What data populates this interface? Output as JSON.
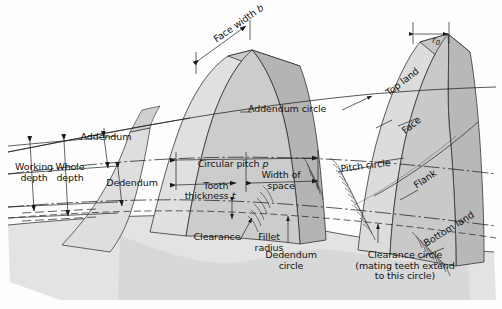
{
  "figure": {
    "colors": {
      "body_light": "#d9d9d9",
      "body_mid": "#c6c6c6",
      "body_dark": "#aaaaaa",
      "body_pale": "#e8e8e8",
      "line": "#1a1a1a",
      "paper": "#fdfdfd",
      "text": "#141414"
    }
  },
  "labels": {
    "face_width": "Face width",
    "face_width_sym": "b",
    "addendum": "Addendum",
    "working_depth": "Working\ndepth",
    "whole_depth": "Whole\ndepth",
    "dedendum": "Dedendum",
    "addendum_circle": "Addendum circle",
    "circular_pitch": "Circular pitch",
    "circular_pitch_sym": "p",
    "tooth_thickness": "Tooth\nthickness",
    "tooth_thickness_sym": "t",
    "width_of_space": "Width of\nspace",
    "pitch_circle": "Pitch circle",
    "clearance": "Clearance",
    "fillet_radius": "Fillet\nradius",
    "dedendum_circle": "Dedendum\ncircle",
    "clearance_circle": "Clearance circle\n(mating teeth extend\nto this circle)",
    "top_land": "Top land",
    "face": "Face",
    "flank": "Flank",
    "bottom_land": "Bottom land",
    "top_radius_sym": "r",
    "top_radius_subscript": "0"
  }
}
